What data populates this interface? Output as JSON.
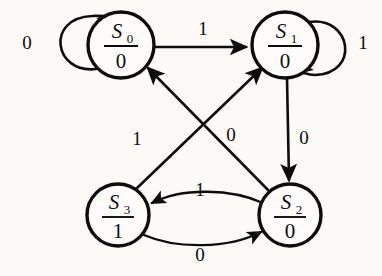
{
  "diagram": {
    "type": "state-transition-diagram",
    "title": "",
    "background_color": "#fbfaf7",
    "stroke_color": "#0d0d0d",
    "states": [
      {
        "id": "s0",
        "name": "S",
        "subscript": "0",
        "output": "0",
        "cx": 121,
        "cy": 45,
        "r": 33
      },
      {
        "id": "s1",
        "name": "S",
        "subscript": "1",
        "output": "0",
        "cx": 285,
        "cy": 45,
        "r": 33
      },
      {
        "id": "s3",
        "name": "S",
        "subscript": "3",
        "output": "1",
        "cx": 118,
        "cy": 215,
        "r": 31
      },
      {
        "id": "s2",
        "name": "S",
        "subscript": "2",
        "output": "0",
        "cx": 290,
        "cy": 215,
        "r": 31
      }
    ],
    "transitions": [
      {
        "id": "t-s0-s0",
        "from": "s0",
        "to": "s0",
        "input": "0",
        "kind": "self-loop",
        "label_x": 27,
        "label_y": 45
      },
      {
        "id": "t-s0-s1",
        "from": "s0",
        "to": "s1",
        "input": "1",
        "kind": "straight",
        "label_x": 203,
        "label_y": 31
      },
      {
        "id": "t-s1-s1",
        "from": "s1",
        "to": "s1",
        "input": "1",
        "kind": "self-loop",
        "label_x": 363,
        "label_y": 45
      },
      {
        "id": "t-s1-s2",
        "from": "s1",
        "to": "s2",
        "input": "0",
        "kind": "straight",
        "label_x": 304,
        "label_y": 140
      },
      {
        "id": "t-s2-s0",
        "from": "s2",
        "to": "s0",
        "input": "0",
        "kind": "diagonal",
        "label_x": 231,
        "label_y": 137
      },
      {
        "id": "t-s3-s1",
        "from": "s3",
        "to": "s1",
        "input": "1",
        "kind": "diagonal",
        "label_x": 137
      },
      {
        "id": "t-s2-s3",
        "from": "s2",
        "to": "s3",
        "input": "1",
        "kind": "curve",
        "label_x": 200,
        "label_y": 192
      },
      {
        "id": "t-s3-s2",
        "from": "s3",
        "to": "s2",
        "input": "0",
        "kind": "curve",
        "label_x": 200,
        "label_y": 257
      }
    ],
    "labels": {
      "loop_s0": "0",
      "s0_to_s1": "1",
      "loop_s1": "1",
      "s1_to_s2": "0",
      "s2_to_s0": "0",
      "s3_to_s1": "1",
      "s2_to_s3": "1",
      "s3_to_s2": "0"
    }
  }
}
